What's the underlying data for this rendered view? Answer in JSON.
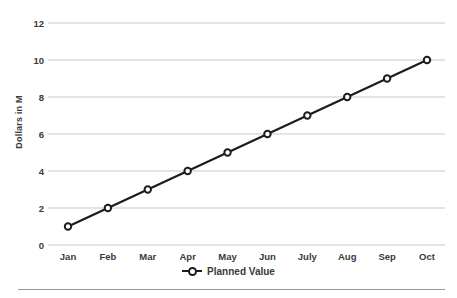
{
  "chart_data": {
    "type": "line",
    "categories": [
      "Jan",
      "Feb",
      "Mar",
      "Apr",
      "May",
      "Jun",
      "July",
      "Aug",
      "Sep",
      "Oct"
    ],
    "series": [
      {
        "name": "Planned Value",
        "values": [
          1,
          2,
          3,
          4,
          5,
          6,
          7,
          8,
          9,
          10
        ]
      }
    ],
    "title": "",
    "xlabel": "",
    "ylabel": "Dollars in M",
    "ylim": [
      0,
      12
    ],
    "y_ticks": [
      0,
      2,
      4,
      6,
      8,
      10,
      12
    ],
    "grid": "horizontal",
    "legend_position": "bottom-center",
    "colors": {
      "line": "#1c1c1c",
      "marker_fill": "#ffffff",
      "marker_stroke": "#1c1c1c",
      "gridline": "#c9c9c9",
      "tick_text": "#3a3a3a",
      "background": "#ffffff",
      "divider": "#9a9a9a"
    }
  }
}
